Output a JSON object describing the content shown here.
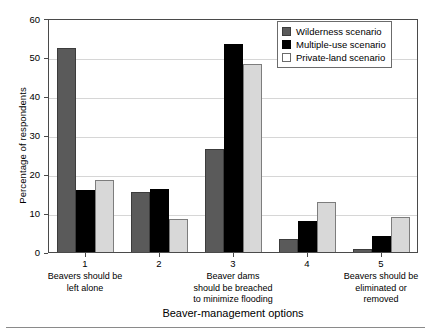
{
  "chart_data": {
    "type": "bar",
    "title": "",
    "xlabel": "Beaver-management options",
    "ylabel": "Percentage of respondents",
    "ylim": [
      0,
      60
    ],
    "yticks": [
      0,
      10,
      20,
      30,
      40,
      50,
      60
    ],
    "grid": true,
    "legend_position": "top-right",
    "categories": [
      "1",
      "2",
      "3",
      "4",
      "5"
    ],
    "category_sublabels": [
      "Beavers should be\nleft alone",
      "",
      "Beaver dams\nshould be breached\nto minimize flooding",
      "",
      "Beavers should be\neliminated or\nremoved"
    ],
    "series": [
      {
        "name": "Wilderness scenario",
        "color": "#5a5a5a",
        "values": [
          52.5,
          15.5,
          26.5,
          3.3,
          0.7
        ]
      },
      {
        "name": "Multiple-use scenario",
        "color": "#000000",
        "values": [
          16.0,
          16.3,
          53.5,
          8.0,
          4.0
        ]
      },
      {
        "name": "Private-land scenario",
        "color": "#d8d8d8",
        "values": [
          18.5,
          8.5,
          48.5,
          13.0,
          9.0
        ]
      }
    ]
  }
}
